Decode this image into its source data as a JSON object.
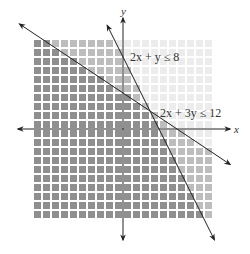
{
  "chart_data": {
    "type": "inequality-graph",
    "title": "",
    "xlabel": "x",
    "ylabel": "y",
    "xlim": [
      -10,
      10
    ],
    "ylim": [
      -10,
      10
    ],
    "grid": true,
    "inequalities": [
      {
        "label": "2x + y ≤ 8",
        "a": 2,
        "b": 1,
        "c": 8,
        "op": "<=",
        "x_intercept": 4,
        "y_intercept": 8
      },
      {
        "label": "2x + 3y ≤ 12",
        "a": 2,
        "b": 3,
        "c": 12,
        "op": "<=",
        "x_intercept": 6,
        "y_intercept": 4
      }
    ],
    "intersection": [
      3,
      2
    ],
    "shading": {
      "both": "#8f8f8f",
      "one": "#bdbdbd",
      "none": "#ececec"
    }
  },
  "labels": {
    "x_axis": "x",
    "y_axis": "y",
    "ineq1": "2x + y ≤ 8",
    "ineq2": "2x + 3y ≤ 12"
  }
}
